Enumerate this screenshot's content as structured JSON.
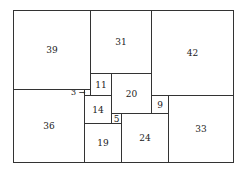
{
  "diagram": {
    "width_units": 112,
    "height_units": 75,
    "squares": [
      {
        "label": "39",
        "size": 39,
        "x": 0,
        "y": 0
      },
      {
        "label": "31",
        "size": 31,
        "x": 39,
        "y": 0
      },
      {
        "label": "42",
        "size": 42,
        "x": 70,
        "y": 0
      },
      {
        "label": "36",
        "size": 36,
        "x": 0,
        "y": 39
      },
      {
        "label": "3",
        "size": 3,
        "x": 36,
        "y": 39,
        "external_label": true
      },
      {
        "label": "11",
        "size": 11,
        "x": 39,
        "y": 31
      },
      {
        "label": "20",
        "size": 20,
        "x": 50,
        "y": 31
      },
      {
        "label": "14",
        "size": 14,
        "x": 36,
        "y": 42
      },
      {
        "label": "5",
        "size": 5,
        "x": 50,
        "y": 51
      },
      {
        "label": "19",
        "size": 19,
        "x": 36,
        "y": 56
      },
      {
        "label": "24",
        "size": 24,
        "x": 55,
        "y": 51
      },
      {
        "label": "9",
        "size": 9,
        "x": 70,
        "y": 42
      },
      {
        "label": "33",
        "size": 33,
        "x": 79,
        "y": 42
      }
    ]
  }
}
